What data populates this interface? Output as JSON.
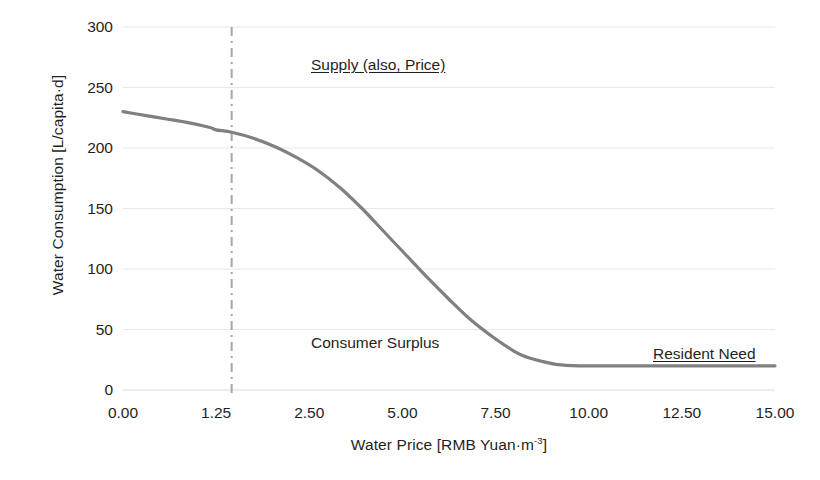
{
  "chart_data": {
    "type": "line",
    "title": "",
    "xlabel": "Water Price [RMB Yuan·m-3]",
    "xlabel_base": "Water Price [RMB Yuan·m",
    "xlabel_sup": "-3",
    "xlabel_tail": "]",
    "ylabel": "Water Consumption [L/capita·d]",
    "xlim": [
      0,
      15
    ],
    "ylim": [
      0,
      300
    ],
    "grid": true,
    "legend": "none",
    "x_tick_labels": [
      "0.00",
      "1.25",
      "2.50",
      "5.00",
      "7.50",
      "10.00",
      "12.50",
      "15.00"
    ],
    "y_tick_labels": [
      "0",
      "50",
      "100",
      "150",
      "200",
      "250",
      "300"
    ],
    "y_ticks": [
      0,
      50,
      100,
      150,
      200,
      250,
      300
    ],
    "series": [
      {
        "name": "Water demand curve",
        "color": "#808080",
        "x": [
          0.0,
          0.5,
          1.0,
          1.5,
          2.0,
          2.14,
          2.5,
          3.0,
          3.5,
          4.0,
          4.5,
          5.0,
          5.5,
          6.0,
          6.5,
          7.0,
          7.5,
          8.0,
          8.5,
          9.0,
          9.3,
          9.6,
          10.0,
          10.5,
          11.0,
          12.0,
          13.0,
          14.0,
          15.0
        ],
        "y": [
          230,
          227,
          224,
          221,
          217,
          215,
          213,
          208,
          201,
          192,
          181,
          167,
          150,
          131,
          112,
          93,
          75,
          58,
          44,
          32,
          27,
          24,
          21,
          20,
          20,
          20,
          20,
          20,
          20
        ]
      }
    ],
    "markers": [
      {
        "name": "supply-price-line",
        "type": "vline",
        "x": 2.5,
        "style": "dash-dot",
        "color": "#a6a6a6",
        "label": "Supply (also, Price)"
      }
    ],
    "annotations": [
      {
        "name": "supply-label",
        "text": "Supply (also, Price)",
        "underline": true,
        "x": 2.5,
        "y": 268
      },
      {
        "name": "surplus-label",
        "text": "Consumer Surplus",
        "underline": false,
        "x": 2.5,
        "y": 60
      },
      {
        "name": "resident-label",
        "text": "Resident Need",
        "underline": true,
        "x": 10.5,
        "y": 45
      }
    ]
  },
  "axes": {
    "x_title_base": "Water Price [RMB Yuan·m",
    "x_title_sup": "-3",
    "x_title_tail": "]",
    "y_title": "Water Consumption [L/capita·d]"
  },
  "annotations": {
    "supply": "Supply (also, Price)",
    "consumer_surplus": "Consumer Surplus",
    "resident_need": "Resident Need"
  },
  "colors": {
    "curve": "#808080",
    "vline": "#a6a6a6",
    "grid": "#e8e8ec",
    "axis": "#d9d9de",
    "text": "#1f1f1f",
    "background": "#ffffff"
  }
}
